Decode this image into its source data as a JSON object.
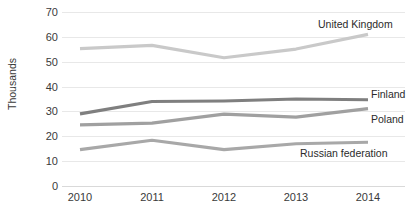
{
  "chart_data": {
    "type": "line",
    "title": "",
    "xlabel": "",
    "ylabel": "Thousands",
    "categories": [
      "2010",
      "2011",
      "2012",
      "2013",
      "2014"
    ],
    "x": [
      2010,
      2011,
      2012,
      2013,
      2014
    ],
    "ylim": [
      0,
      70
    ],
    "yticks": [
      0,
      10,
      20,
      30,
      40,
      50,
      60,
      70
    ],
    "ytick_labels": [
      "0",
      "10",
      "20",
      "30",
      "40",
      "50",
      "60",
      "70"
    ],
    "grid": true,
    "legend_position": "inline-right-of-line-ends",
    "series": [
      {
        "name": "United Kingdom",
        "values": [
          55.5,
          56.8,
          51.8,
          55.3,
          61.2
        ],
        "color": "#c9c9c9"
      },
      {
        "name": "Finland",
        "values": [
          29.2,
          34.2,
          34.4,
          35.2,
          34.9
        ],
        "color": "#7f7f7f"
      },
      {
        "name": "Poland",
        "values": [
          24.8,
          25.5,
          29.1,
          27.9,
          31.3
        ],
        "color": "#a0a0a0"
      },
      {
        "name": "Russian federation",
        "values": [
          14.8,
          18.6,
          14.8,
          17.2,
          17.8
        ],
        "color": "#a8a8a8"
      }
    ]
  },
  "axis": {
    "y_title": "Thousands",
    "y_labels": [
      "70",
      "60",
      "50",
      "40",
      "30",
      "20",
      "10",
      "0"
    ],
    "x_labels": [
      "2010",
      "2011",
      "2012",
      "2013",
      "2014"
    ]
  },
  "labels": {
    "united_kingdom": "United Kingdom",
    "finland": "Finland",
    "poland": "Poland",
    "russian_federation": "Russian federation"
  },
  "colors": {
    "grid": "#e8e8e8",
    "text": "#3a3a3a",
    "uk": "#c9c9c9",
    "finland": "#7f7f7f",
    "poland": "#a0a0a0",
    "russia": "#a8a8a8"
  }
}
